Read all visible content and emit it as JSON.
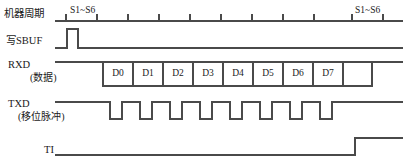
{
  "diagram": {
    "width": 407,
    "height": 161,
    "stroke_color": "#4a4a4a",
    "text_color": "#1a1a1a",
    "background": "#ffffff"
  },
  "rows": [
    {
      "id": "machine-cycle",
      "label": "机器周期",
      "sub_label": "",
      "label_x": 4,
      "label_y": 9,
      "baseline_y": 21
    },
    {
      "id": "write-sbuf",
      "label": "写SBUF",
      "sub_label": "",
      "label_x": 6,
      "label_y": 36,
      "baseline_y": 48
    },
    {
      "id": "rxd-data",
      "label": "RXD",
      "sub_label": "(数据)",
      "label_x": 8,
      "label_y": 60,
      "sub_label_x": 30,
      "sub_label_y": 73,
      "baseline_y": 62
    },
    {
      "id": "txd-shift-pulse",
      "label": "TXD",
      "sub_label": "(移位脉冲)",
      "label_x": 8,
      "label_y": 99,
      "sub_label_x": 18,
      "sub_label_y": 112,
      "baseline_y": 102
    },
    {
      "id": "ti-flag",
      "label": "TI",
      "sub_label": "",
      "label_x": 44,
      "label_y": 145,
      "baseline_y": 148
    }
  ],
  "phase_markers": [
    {
      "id": "phase-left",
      "text": "S1~S6",
      "x": 70,
      "y": 6
    },
    {
      "id": "phase-right",
      "text": "S1~S6",
      "x": 355,
      "y": 6
    }
  ],
  "clock": {
    "line_start_x": 55,
    "line_end_x": 403,
    "tick_height": 7,
    "tick_positions": [
      66,
      97,
      128,
      159,
      190,
      221,
      252,
      283,
      314,
      352,
      383
    ]
  },
  "write_sbuf_pulse": {
    "line_start_x": 55,
    "line_end_x": 403,
    "rise_x": 67,
    "fall_x": 78,
    "pulse_top_y": 29
  },
  "rxd": {
    "line_start_x": 55,
    "line_end_x": 403,
    "box_top_y": 62,
    "box_bottom_y": 86,
    "box_start_x": 103,
    "box_width": 30,
    "tail_end_x": 403,
    "bits": [
      "D0",
      "D1",
      "D2",
      "D3",
      "D4",
      "D5",
      "D6",
      "D7"
    ]
  },
  "txd": {
    "line_start_x": 55,
    "line_end_x": 403,
    "high_y": 102,
    "low_y": 119,
    "first_pulse_start_x": 110,
    "pulse_width": 12,
    "pulse_period": 30,
    "pulse_count": 8,
    "tail_start_x": 350
  },
  "ti": {
    "line_start_x": 55,
    "line_end_x": 403,
    "low_y": 155,
    "high_y": 138,
    "rise_x": 355
  }
}
